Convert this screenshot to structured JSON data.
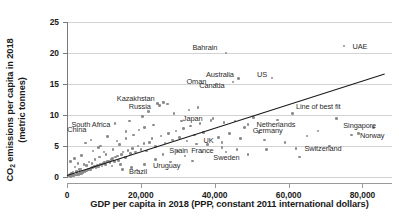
{
  "chart_data": {
    "type": "scatter",
    "title": "",
    "xlabel": "GDP per capita in 2018 (PPP, constant 2011 international dollars)",
    "ylabel_line1": "CO",
    "ylabel_sub": "2",
    "ylabel_line1_rest": " emissions per capita in 2018",
    "ylabel_line2": "(metric tonnes)",
    "xlim": [
      0,
      88000
    ],
    "ylim": [
      0,
      25
    ],
    "xticks": [
      0,
      20000,
      40000,
      60000,
      80000
    ],
    "xtick_labels": [
      "0",
      "20,000",
      "40,000",
      "60,000",
      "80,000"
    ],
    "yticks": [
      0,
      5,
      10,
      15,
      20,
      25
    ],
    "ytick_labels": [
      "0",
      "5",
      "10",
      "15",
      "20",
      "25"
    ],
    "grid": "horizontal",
    "legend": "none",
    "marker_color": "#8c8c8c",
    "fit_line_color": "#1a1a1a",
    "grid_color": "#d2d2d2",
    "fit_line": {
      "label": "Line of best fit",
      "x0": 0,
      "y0": 0.25,
      "x1": 86000,
      "y1": 16.6
    },
    "labeled_points": [
      {
        "name": "Bahrain",
        "x": 43000,
        "y": 20.0,
        "label_x": 41500,
        "label_y": 20.9,
        "align": "r"
      },
      {
        "name": "UAE",
        "x": 75000,
        "y": 21.1,
        "label_x": 76500,
        "label_y": 21.1,
        "align": "l"
      },
      {
        "name": "Oman",
        "x": 40500,
        "y": 15.0,
        "label_x": 38500,
        "label_y": 15.5,
        "align": "r"
      },
      {
        "name": "Australia",
        "x": 46500,
        "y": 15.9,
        "label_x": 46000,
        "label_y": 16.6,
        "align": "r"
      },
      {
        "name": "US",
        "x": 55500,
        "y": 16.0,
        "label_x": 55000,
        "label_y": 16.6,
        "align": "r"
      },
      {
        "name": "Canada",
        "x": 45000,
        "y": 15.3,
        "label_x": 43500,
        "label_y": 14.8,
        "align": "r"
      },
      {
        "name": "Kazakhstan",
        "x": 26000,
        "y": 12.1,
        "label_x": 24500,
        "label_y": 12.8,
        "align": "r"
      },
      {
        "name": "Russia",
        "x": 25000,
        "y": 11.5,
        "label_x": 23500,
        "label_y": 11.5,
        "align": "r"
      },
      {
        "name": "South Africa",
        "x": 13000,
        "y": 8.6,
        "label_x": 12500,
        "label_y": 8.6,
        "align": "r"
      },
      {
        "name": "China",
        "x": 16000,
        "y": 7.3,
        "label_x": 6000,
        "label_y": 7.8,
        "align": "r"
      },
      {
        "name": "Japan",
        "x": 39000,
        "y": 9.1,
        "label_x": 37500,
        "label_y": 9.5,
        "align": "r"
      },
      {
        "name": "Netherlands",
        "x": 49000,
        "y": 8.5,
        "label_x": 50500,
        "label_y": 8.5,
        "align": "l"
      },
      {
        "name": "Germany",
        "x": 48000,
        "y": 8.0,
        "label_x": 49500,
        "label_y": 7.6,
        "align": "l"
      },
      {
        "name": "Singapore",
        "x": 83000,
        "y": 8.0,
        "label_x": 74000,
        "label_y": 8.4,
        "align": "l"
      },
      {
        "name": "Norway",
        "x": 77000,
        "y": 6.8,
        "label_x": 78500,
        "label_y": 6.8,
        "align": "l"
      },
      {
        "name": "UK",
        "x": 42000,
        "y": 5.6,
        "label_x": 40500,
        "label_y": 5.9,
        "align": "r"
      },
      {
        "name": "Switzerland",
        "x": 62000,
        "y": 4.6,
        "label_x": 63500,
        "label_y": 4.6,
        "align": "l"
      },
      {
        "name": "France",
        "x": 42000,
        "y": 4.8,
        "label_x": 40500,
        "label_y": 4.4,
        "align": "r"
      },
      {
        "name": "Spain",
        "x": 35000,
        "y": 5.3,
        "label_x": 33500,
        "label_y": 4.4,
        "align": "r"
      },
      {
        "name": "Sweden",
        "x": 49000,
        "y": 3.6,
        "label_x": 47500,
        "label_y": 3.3,
        "align": "r"
      },
      {
        "name": "Uruguay",
        "x": 21000,
        "y": 2.0,
        "label_x": 22500,
        "label_y": 2.0,
        "align": "l"
      },
      {
        "name": "Brazil",
        "x": 14500,
        "y": 2.0,
        "label_x": 16000,
        "label_y": 1.0,
        "align": "l"
      }
    ],
    "unlabeled_points": [
      [
        800,
        0.1
      ],
      [
        1100,
        0.1
      ],
      [
        1300,
        0.15
      ],
      [
        1500,
        0.2
      ],
      [
        1700,
        0.2
      ],
      [
        1900,
        0.25
      ],
      [
        2100,
        0.3
      ],
      [
        2300,
        0.3
      ],
      [
        2500,
        0.35
      ],
      [
        2700,
        0.4
      ],
      [
        2900,
        0.4
      ],
      [
        3100,
        0.5
      ],
      [
        3300,
        0.45
      ],
      [
        3500,
        0.55
      ],
      [
        3700,
        0.6
      ],
      [
        3900,
        0.6
      ],
      [
        4100,
        0.7
      ],
      [
        4300,
        0.75
      ],
      [
        4500,
        0.8
      ],
      [
        4700,
        0.85
      ],
      [
        4900,
        0.9
      ],
      [
        5100,
        1.0
      ],
      [
        5300,
        1.05
      ],
      [
        5500,
        1.1
      ],
      [
        5700,
        1.15
      ],
      [
        5900,
        1.2
      ],
      [
        6100,
        1.3
      ],
      [
        6300,
        1.25
      ],
      [
        6500,
        1.4
      ],
      [
        6700,
        1.45
      ],
      [
        6900,
        1.5
      ],
      [
        7200,
        1.6
      ],
      [
        7500,
        1.7
      ],
      [
        7800,
        1.5
      ],
      [
        8000,
        1.8
      ],
      [
        8300,
        1.9
      ],
      [
        8600,
        1.6
      ],
      [
        8900,
        2.0
      ],
      [
        9200,
        2.1
      ],
      [
        9500,
        1.8
      ],
      [
        9800,
        2.2
      ],
      [
        10200,
        2.4
      ],
      [
        10500,
        2.0
      ],
      [
        10900,
        2.5
      ],
      [
        11200,
        2.6
      ],
      [
        11600,
        2.3
      ],
      [
        12000,
        2.8
      ],
      [
        12400,
        3.0
      ],
      [
        12800,
        2.5
      ],
      [
        13200,
        3.2
      ],
      [
        13600,
        3.4
      ],
      [
        14000,
        2.7
      ],
      [
        14800,
        3.6
      ],
      [
        15200,
        4.0
      ],
      [
        15800,
        3.1
      ],
      [
        16500,
        4.3
      ],
      [
        17200,
        3.8
      ],
      [
        17800,
        4.6
      ],
      [
        18500,
        4.0
      ],
      [
        19200,
        5.0
      ],
      [
        20000,
        4.4
      ],
      [
        20800,
        5.4
      ],
      [
        21500,
        4.2
      ],
      [
        22300,
        5.6
      ],
      [
        23000,
        6.2
      ],
      [
        24000,
        4.9
      ],
      [
        25500,
        6.6
      ],
      [
        26500,
        5.5
      ],
      [
        27500,
        7.0
      ],
      [
        28500,
        6.0
      ],
      [
        29500,
        7.4
      ],
      [
        30500,
        6.4
      ],
      [
        31500,
        7.8
      ],
      [
        32500,
        5.8
      ],
      [
        33500,
        8.2
      ],
      [
        34500,
        6.8
      ],
      [
        36000,
        8.6
      ],
      [
        37000,
        7.2
      ],
      [
        38000,
        5.2
      ],
      [
        39500,
        9.4
      ],
      [
        41000,
        6.4
      ],
      [
        42500,
        8.8
      ],
      [
        44000,
        7.0
      ],
      [
        45500,
        9.0
      ],
      [
        47000,
        6.2
      ],
      [
        50500,
        9.6
      ],
      [
        52000,
        7.2
      ],
      [
        53500,
        6.0
      ],
      [
        57000,
        9.2
      ],
      [
        59000,
        5.6
      ],
      [
        61000,
        10.2
      ],
      [
        65000,
        6.6
      ],
      [
        68000,
        7.4
      ],
      [
        71000,
        5.0
      ],
      [
        73000,
        9.4
      ],
      [
        79000,
        7.0
      ],
      [
        5000,
        5.5
      ],
      [
        6500,
        6.0
      ],
      [
        9000,
        5.0
      ],
      [
        11000,
        6.5
      ],
      [
        13500,
        5.8
      ],
      [
        16000,
        6.2
      ],
      [
        18000,
        6.8
      ],
      [
        19500,
        7.6
      ],
      [
        21000,
        8.0
      ],
      [
        23500,
        8.4
      ],
      [
        17000,
        9.0
      ],
      [
        20500,
        9.8
      ],
      [
        22000,
        10.6
      ],
      [
        24500,
        11.9
      ],
      [
        26200,
        12.0
      ],
      [
        27200,
        11.8
      ],
      [
        29000,
        10.2
      ],
      [
        31000,
        9.0
      ],
      [
        33000,
        10.8
      ],
      [
        35500,
        11.2
      ],
      [
        1000,
        2.5
      ],
      [
        2000,
        3.0
      ],
      [
        3000,
        2.2
      ],
      [
        4000,
        3.5
      ],
      [
        7000,
        4.2
      ],
      [
        8500,
        4.8
      ],
      [
        10000,
        4.0
      ],
      [
        12500,
        4.4
      ],
      [
        14200,
        5.2
      ],
      [
        30000,
        4.2
      ],
      [
        36500,
        4.0
      ],
      [
        43000,
        4.0
      ],
      [
        46000,
        4.4
      ],
      [
        54000,
        4.4
      ],
      [
        63000,
        3.2
      ],
      [
        15000,
        1.2
      ],
      [
        17500,
        1.5
      ],
      [
        19000,
        1.1
      ],
      [
        24000,
        2.8
      ],
      [
        26000,
        3.6
      ],
      [
        28000,
        2.4
      ],
      [
        32000,
        3.4
      ],
      [
        34000,
        2.6
      ],
      [
        2200,
        1.6
      ],
      [
        3400,
        1.2
      ],
      [
        4600,
        2.0
      ],
      [
        6000,
        2.4
      ],
      [
        7600,
        2.8
      ],
      [
        8800,
        3.2
      ],
      [
        10600,
        3.6
      ],
      [
        12200,
        1.8
      ],
      [
        1600,
        0.8
      ],
      [
        900,
        0.5
      ],
      [
        600,
        0.2
      ],
      [
        400,
        0.15
      ],
      [
        1200,
        0.6
      ],
      [
        2600,
        0.9
      ],
      [
        3800,
        1.3
      ],
      [
        5200,
        1.9
      ],
      [
        6800,
        2.2
      ]
    ]
  }
}
